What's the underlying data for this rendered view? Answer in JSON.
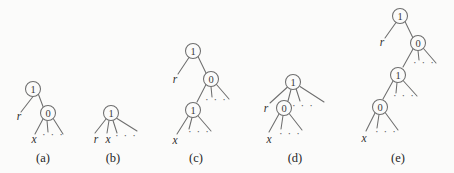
{
  "figure": {
    "background_color": "#fbfbfa",
    "stroke_color": "#6e6e6e",
    "text_color": "#2e2e2e",
    "width": 454,
    "height": 173,
    "dots_text": "· · ·"
  },
  "chart_data": {
    "type": "diagram",
    "title": "",
    "subfigures": [
      {
        "id": "a",
        "caption": "(a)",
        "caption_pos": [
          43,
          158
        ],
        "nodes": [
          {
            "name": "node-a-root",
            "label": "1",
            "x": 33,
            "y": 89,
            "r": 7.5
          },
          {
            "name": "node-a-child",
            "label": "0",
            "x": 48,
            "y": 113,
            "r": 7.5
          }
        ],
        "leaf_labels": [
          {
            "name": "leaf-a-r",
            "label": "r",
            "x": 19,
            "y": 116
          },
          {
            "name": "leaf-a-x",
            "label": "x",
            "x": 34,
            "y": 139
          }
        ],
        "dots": [
          {
            "name": "dots-a",
            "x": 53,
            "y": 134
          }
        ],
        "edges": [
          [
            33,
            96.5,
            21,
            112
          ],
          [
            38.5,
            94.5,
            43,
            106.5
          ],
          [
            43,
            119,
            35,
            134
          ],
          [
            47,
            120.5,
            48,
            132
          ],
          [
            53.5,
            119,
            63,
            134
          ]
        ]
      },
      {
        "id": "b",
        "caption": "(b)",
        "caption_pos": [
          113,
          158
        ],
        "nodes": [
          {
            "name": "node-b-root",
            "label": "1",
            "x": 111,
            "y": 113,
            "r": 7.5
          }
        ],
        "leaf_labels": [
          {
            "name": "leaf-b-r",
            "label": "r",
            "x": 96,
            "y": 139
          },
          {
            "name": "leaf-b-x",
            "label": "x",
            "x": 108,
            "y": 139
          }
        ],
        "dots": [
          {
            "name": "dots-b",
            "x": 126,
            "y": 135
          }
        ],
        "edges": [
          [
            106,
            119,
            95,
            133
          ],
          [
            109,
            120.5,
            107,
            133
          ],
          [
            113,
            120.5,
            117,
            133
          ],
          [
            117,
            118.5,
            137,
            131
          ]
        ]
      },
      {
        "id": "c",
        "caption": "(c)",
        "caption_pos": [
          196,
          158
        ],
        "nodes": [
          {
            "name": "node-c-root",
            "label": "1",
            "x": 193,
            "y": 51,
            "r": 7.5
          },
          {
            "name": "node-c-mid",
            "label": "0",
            "x": 211,
            "y": 79,
            "r": 7.5
          },
          {
            "name": "node-c-low",
            "label": "1",
            "x": 193,
            "y": 110,
            "r": 7.5
          }
        ],
        "leaf_labels": [
          {
            "name": "leaf-c-r",
            "label": "r",
            "x": 175,
            "y": 79
          },
          {
            "name": "leaf-c-x",
            "label": "x",
            "x": 175,
            "y": 140
          }
        ],
        "dots": [
          {
            "name": "dots-c-mid",
            "x": 216,
            "y": 99
          },
          {
            "name": "dots-c-low",
            "x": 199,
            "y": 131
          }
        ],
        "edges": [
          [
            189,
            57.5,
            178,
            74
          ],
          [
            198,
            56.5,
            206,
            73
          ],
          [
            206,
            84.5,
            197,
            102
          ],
          [
            211,
            86.5,
            212,
            97
          ],
          [
            216.5,
            84.5,
            229,
            99
          ],
          [
            188,
            116.5,
            177,
            134
          ],
          [
            192,
            117.5,
            189,
            129
          ],
          [
            198.5,
            116.5,
            211,
            131
          ]
        ]
      },
      {
        "id": "d",
        "caption": "(d)",
        "caption_pos": [
          295,
          158
        ],
        "nodes": [
          {
            "name": "node-d-root",
            "label": "1",
            "x": 293,
            "y": 82,
            "r": 7.5
          },
          {
            "name": "node-d-child",
            "label": "0",
            "x": 284,
            "y": 108,
            "r": 7.5
          }
        ],
        "leaf_labels": [
          {
            "name": "leaf-d-r",
            "label": "r",
            "x": 266,
            "y": 108
          },
          {
            "name": "leaf-d-x",
            "label": "x",
            "x": 269,
            "y": 139
          }
        ],
        "dots": [
          {
            "name": "dots-d-root",
            "x": 303,
            "y": 105
          },
          {
            "name": "dots-d-child",
            "x": 290,
            "y": 133
          }
        ],
        "edges": [
          [
            287,
            87.5,
            270,
            103
          ],
          [
            291,
            89.5,
            288,
            101
          ],
          [
            296,
            88.5,
            300,
            101
          ],
          [
            300,
            86.5,
            324,
            102
          ],
          [
            279,
            114,
            269,
            132
          ],
          [
            283,
            115.5,
            281,
            129
          ],
          [
            289.5,
            114,
            302,
            130
          ]
        ]
      },
      {
        "id": "e",
        "caption": "(e)",
        "caption_pos": [
          398,
          158
        ],
        "nodes": [
          {
            "name": "node-e-root",
            "label": "1",
            "x": 400,
            "y": 16,
            "r": 7.5
          },
          {
            "name": "node-e-l2",
            "label": "0",
            "x": 418,
            "y": 43,
            "r": 7.5
          },
          {
            "name": "node-e-l3",
            "label": "1",
            "x": 398,
            "y": 75,
            "r": 7.5
          },
          {
            "name": "node-e-l4",
            "label": "0",
            "x": 380,
            "y": 107,
            "r": 7.5
          }
        ],
        "leaf_labels": [
          {
            "name": "leaf-e-r",
            "label": "r",
            "x": 382,
            "y": 42
          },
          {
            "name": "leaf-e-x",
            "label": "x",
            "x": 364,
            "y": 138
          }
        ],
        "dots": [
          {
            "name": "dots-e-l2",
            "x": 424,
            "y": 62
          },
          {
            "name": "dots-e-l3",
            "x": 404,
            "y": 95
          },
          {
            "name": "dots-e-l4",
            "x": 386,
            "y": 131
          }
        ],
        "edges": [
          [
            396,
            22.5,
            385,
            38
          ],
          [
            405,
            21.5,
            413,
            38
          ],
          [
            413,
            49,
            403,
            67
          ],
          [
            418,
            50.5,
            419,
            60
          ],
          [
            423.5,
            48.5,
            436,
            63
          ],
          [
            393,
            81,
            383,
            99
          ],
          [
            397,
            82.5,
            396,
            93
          ],
          [
            403.5,
            81,
            417,
            96
          ],
          [
            375,
            113,
            366,
            131
          ],
          [
            379,
            114.5,
            377,
            128
          ],
          [
            385.5,
            113,
            398,
            130
          ]
        ]
      }
    ]
  }
}
